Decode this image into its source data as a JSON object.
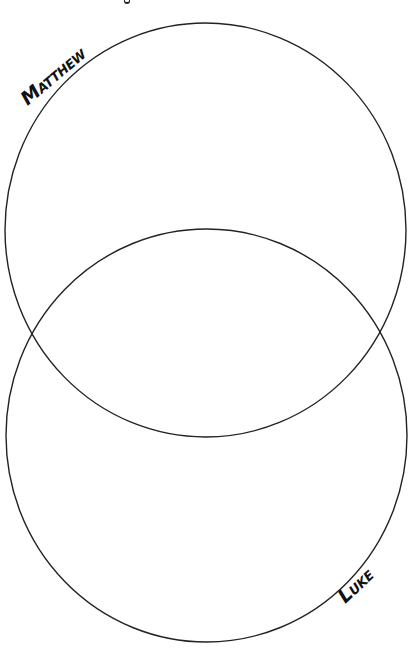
{
  "diagram": {
    "type": "venn",
    "sets": [
      {
        "id": "matthew",
        "label_cap": "M",
        "label_rest": "ATTHEW",
        "label_full": "MATTHEW",
        "position": "top"
      },
      {
        "id": "luke",
        "label_cap": "L",
        "label_rest": "UKE",
        "label_full": "LUKE",
        "position": "bottom"
      }
    ],
    "colors": {
      "stroke": "#222222",
      "background": "#ffffff",
      "label": "#111111"
    }
  }
}
